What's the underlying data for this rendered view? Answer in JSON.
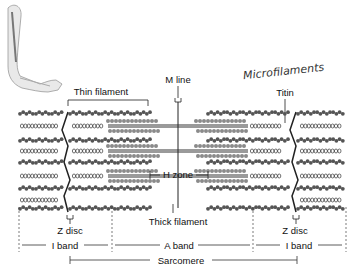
{
  "labels": {
    "thin_filament": "Thin filament",
    "m_line": "M line",
    "titin": "Titin",
    "handwritten_note": "Microfilaments",
    "h_zone": "H zone",
    "thick_filament": "Thick filament",
    "z_disc_left": "Z disc",
    "z_disc_right": "Z disc",
    "i_band_left": "I band",
    "a_band": "A band",
    "i_band_right": "I band",
    "sarcomere": "Sarcomere"
  },
  "illustration": {
    "arm": "arm-illustration",
    "colors": {
      "filament": "#555555",
      "thick_filament": "#9a9a9a",
      "text": "#111111"
    }
  }
}
